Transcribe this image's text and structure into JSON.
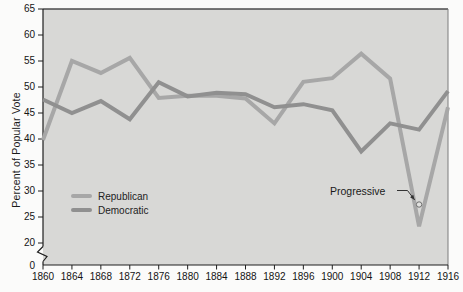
{
  "chart_data": {
    "type": "line",
    "title": "",
    "xlabel": "",
    "ylabel": "Percent of Popular Vote",
    "xlim": [
      1860,
      1916
    ],
    "ylim": [
      20,
      65
    ],
    "axis_break_below": 20,
    "origin_tick_label": "0",
    "grid": false,
    "legend_position": "inside-bottom-left",
    "plot_background": "#d8d8d6",
    "x": [
      1860,
      1864,
      1868,
      1872,
      1876,
      1880,
      1884,
      1888,
      1892,
      1896,
      1900,
      1904,
      1908,
      1912,
      1916
    ],
    "y_ticks": [
      20,
      25,
      30,
      35,
      40,
      45,
      50,
      55,
      60,
      65
    ],
    "series": [
      {
        "name": "Republican",
        "color": "#a7a7a7",
        "values": [
          39.8,
          55.0,
          52.7,
          55.6,
          47.9,
          48.3,
          48.3,
          47.8,
          43.0,
          51.0,
          51.7,
          56.4,
          51.6,
          23.2,
          46.1
        ]
      },
      {
        "name": "Democratic",
        "color": "#909090",
        "values": [
          47.6,
          45.0,
          47.3,
          43.8,
          50.9,
          48.2,
          48.9,
          48.6,
          46.1,
          46.7,
          45.5,
          37.6,
          43.0,
          41.8,
          49.2
        ]
      }
    ],
    "extra_points": [
      {
        "name": "Progressive",
        "x": 1912,
        "y": 27.4,
        "marker": "open-circle"
      }
    ],
    "annotation": {
      "text": "Progressive",
      "points_to": {
        "x": 1912,
        "y": 27.4
      }
    }
  }
}
